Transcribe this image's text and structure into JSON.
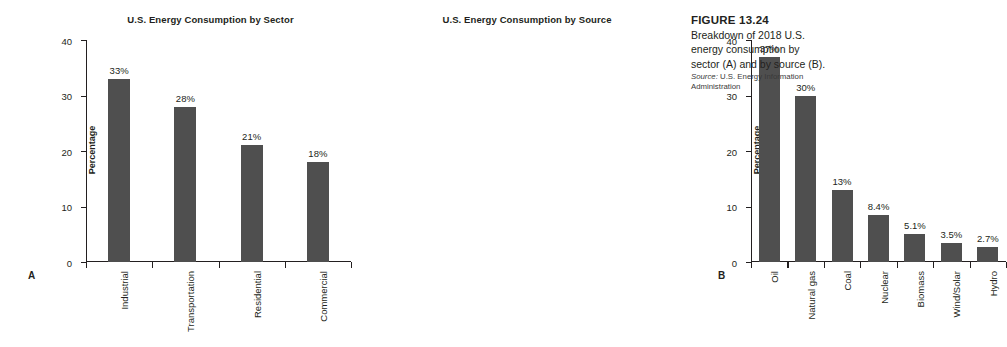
{
  "figure": {
    "number_label": "FIGURE 13.24",
    "caption": "Breakdown of 2018 U.S. energy consumption by sector (A) and by source (B).",
    "source_prefix": "Source:",
    "source_text": " U.S. Energy Information Administration"
  },
  "panels": {
    "a": {
      "letter": "A"
    },
    "b": {
      "letter": "B"
    }
  },
  "colors": {
    "bar": "#4f4f4f",
    "axis": "#231f20",
    "text": "#231f20",
    "background": "#ffffff"
  },
  "chart_data": [
    {
      "panel": "A",
      "type": "bar",
      "title": "U.S. Energy Consumption by Sector",
      "xlabel": "",
      "ylabel": "Percentage",
      "ylim": [
        0,
        40
      ],
      "yticks": [
        0,
        10,
        20,
        30,
        40
      ],
      "ytick_labels": [
        "0",
        "10",
        "20",
        "30",
        "40"
      ],
      "grid": false,
      "legend": "none",
      "categories": [
        "Industrial",
        "Transportation",
        "Residential",
        "Commercial"
      ],
      "values": [
        33,
        28,
        21,
        18
      ],
      "data_labels": [
        "33%",
        "28%",
        "21%",
        "18%"
      ]
    },
    {
      "panel": "B",
      "type": "bar",
      "title": "U.S. Energy Consumption by Source",
      "xlabel": "",
      "ylabel": "Percentage",
      "ylim": [
        0,
        40
      ],
      "yticks": [
        0,
        10,
        20,
        30,
        40
      ],
      "ytick_labels": [
        "0",
        "10",
        "20",
        "30",
        "40"
      ],
      "grid": false,
      "legend": "none",
      "categories": [
        "Oil",
        "Natural gas",
        "Coal",
        "Nuclear",
        "Biomass",
        "Wind/Solar",
        "Hydro"
      ],
      "values": [
        37,
        30,
        13,
        8.4,
        5.1,
        3.5,
        2.7
      ],
      "data_labels": [
        "37%",
        "30%",
        "13%",
        "8.4%",
        "5.1%",
        "3.5%",
        "2.7%"
      ]
    }
  ]
}
